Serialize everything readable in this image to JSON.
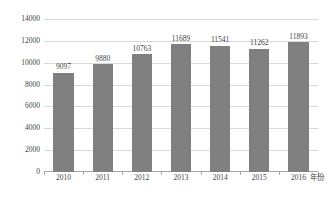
{
  "chart_data": {
    "type": "bar",
    "title": "",
    "subtitle": "",
    "xlabel": "年份",
    "ylabel": "",
    "categories": [
      "2010",
      "2011",
      "2012",
      "2013",
      "2014",
      "2015",
      "2016"
    ],
    "values": [
      9097,
      9880,
      10763,
      11689,
      11541,
      11262,
      11893
    ],
    "data_labels": [
      "9097",
      "9880",
      "10763",
      "11689",
      "11541",
      "11262",
      "11893"
    ],
    "ylim": [
      0,
      14000
    ],
    "ytick_values": [
      0,
      2000,
      4000,
      6000,
      8000,
      10000,
      12000,
      14000
    ],
    "ytick_labels": [
      "0",
      "2000",
      "4000",
      "6000",
      "8000",
      "10000",
      "12000",
      "14000"
    ],
    "grid": true,
    "legend": false,
    "legend_position": "none",
    "series": [
      {
        "name": "",
        "values": [
          9097,
          9880,
          10763,
          11689,
          11541,
          11262,
          11893
        ],
        "color": "#808080"
      }
    ],
    "colors": {
      "bar": "#808080",
      "gridline": "#d9d9d9",
      "axis": "#a6a6a6",
      "text": "#3f3f3f",
      "background": "#ffffff"
    }
  }
}
